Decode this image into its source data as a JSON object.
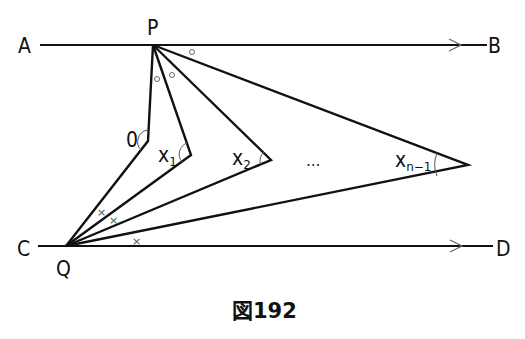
{
  "figure": {
    "caption": "図192",
    "points": {
      "A": "A",
      "B": "B",
      "C": "C",
      "D": "D",
      "P": "P",
      "Q": "Q"
    },
    "angles": {
      "first": "0",
      "x1_base": "x",
      "x1_sub": "1",
      "x2_base": "x",
      "x2_sub": "2",
      "ellipsis": "…",
      "xn_base": "x",
      "xn_sub": "n−1"
    },
    "markers": {
      "circle": "○",
      "cross": "×"
    }
  }
}
